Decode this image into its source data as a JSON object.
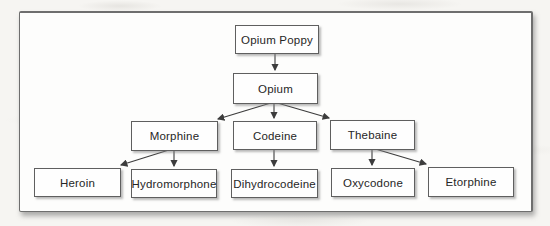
{
  "diagram": {
    "nodes": {
      "opium_poppy": {
        "label": "Opium Poppy"
      },
      "opium": {
        "label": "Opium"
      },
      "morphine": {
        "label": "Morphine"
      },
      "codeine": {
        "label": "Codeine"
      },
      "thebaine": {
        "label": "Thebaine"
      },
      "heroin": {
        "label": "Heroin"
      },
      "hydromorphone": {
        "label": "Hydromorphone"
      },
      "dihydrocodeine": {
        "label": "Dihydrocodeine"
      },
      "oxycodone": {
        "label": "Oxycodone"
      },
      "etorphine": {
        "label": "Etorphine"
      }
    },
    "edges": [
      {
        "from": "opium_poppy",
        "to": "opium"
      },
      {
        "from": "opium",
        "to": "morphine"
      },
      {
        "from": "opium",
        "to": "codeine"
      },
      {
        "from": "opium",
        "to": "thebaine"
      },
      {
        "from": "morphine",
        "to": "heroin"
      },
      {
        "from": "morphine",
        "to": "hydromorphone"
      },
      {
        "from": "codeine",
        "to": "dihydrocodeine"
      },
      {
        "from": "thebaine",
        "to": "oxycodone"
      },
      {
        "from": "thebaine",
        "to": "etorphine"
      }
    ],
    "colors": {
      "page_background": "#f6f5f2",
      "frame_background": "#fdfdfc",
      "frame_border": "#6e6e6e",
      "box_fill": "#fefefe",
      "box_border": "#5f5f5f",
      "text": "#262626",
      "arrow": "#3c3c3c"
    }
  }
}
